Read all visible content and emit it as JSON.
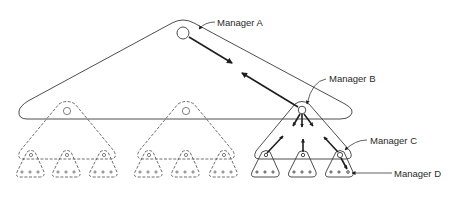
{
  "diagram": {
    "type": "linking-pin hierarchy",
    "labels": {
      "manager_a": "Manager A",
      "manager_b": "Manager B",
      "manager_c": "Manager C",
      "manager_d": "Manager D"
    },
    "colors": {
      "line": "#3a3a3a",
      "arrow": "#1e1e1e",
      "background": "#ffffff"
    },
    "levels": [
      {
        "level": 1,
        "groups": 1,
        "style": "solid"
      },
      {
        "level": 2,
        "groups": 3,
        "style": "dashed except rightmost solid"
      },
      {
        "level": 3,
        "groups": 9,
        "style": "dashed except rightmost three solid"
      }
    ]
  }
}
